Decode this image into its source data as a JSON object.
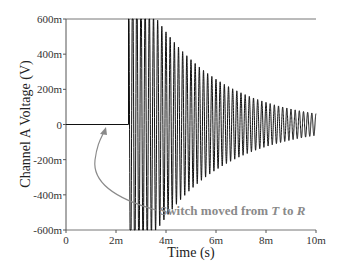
{
  "chart_data": {
    "type": "line",
    "title": "",
    "xlabel": "Time (s)",
    "ylabel": "Channel A Voltage (V)",
    "xlim": [
      0,
      0.01
    ],
    "ylim": [
      -0.6,
      0.6
    ],
    "x_ticks": [
      {
        "value": 0,
        "label": "0"
      },
      {
        "value": 0.002,
        "label": "2m"
      },
      {
        "value": 0.004,
        "label": "4m"
      },
      {
        "value": 0.006,
        "label": "6m"
      },
      {
        "value": 0.008,
        "label": "8m"
      },
      {
        "value": 0.01,
        "label": "10m"
      }
    ],
    "y_ticks": [
      {
        "value": 0.6,
        "label": "600m"
      },
      {
        "value": 0.4,
        "label": "400m"
      },
      {
        "value": 0.2,
        "label": "200m"
      },
      {
        "value": 0,
        "label": "0"
      },
      {
        "value": -0.2,
        "label": "-200m"
      },
      {
        "value": -0.4,
        "label": "-400m"
      },
      {
        "value": -0.6,
        "label": "-600m"
      }
    ],
    "grid": false,
    "legend": null,
    "series": [
      {
        "name": "Channel A",
        "description": "Flat at 0 V until switch at ~2.5 ms, then exponentially decaying sinusoid clipped at ±600 mV initially",
        "switch_time": 0.0025,
        "initial_amplitude": 0.9,
        "decay_time_constant": 0.0028,
        "frequency_hz": 6000,
        "color": "#111111"
      }
    ],
    "annotations": [
      {
        "text_prefix": "Switch moved from ",
        "T": "T",
        "mid": " to ",
        "R": "R",
        "x": 0.0025,
        "y": 0,
        "arrow": true
      }
    ]
  },
  "labels": {
    "xlabel": "Time (s)",
    "ylabel": "Channel A Voltage (V)",
    "annot_prefix": "Switch moved from ",
    "annot_T": "T",
    "annot_mid": " to ",
    "annot_R": "R"
  }
}
